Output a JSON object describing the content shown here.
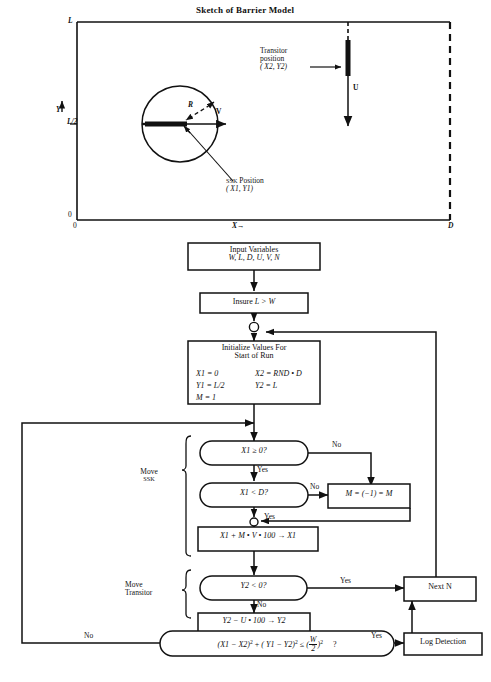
{
  "figure": {
    "title": "Sketch of Barrier Model",
    "sketch": {
      "axis": {
        "y_label": "Y",
        "y_top": "L",
        "y_mid": "L/2",
        "y_zero": "0",
        "x_zero": "0",
        "x_label": "X",
        "x_right": "D"
      },
      "annotations": {
        "radius": "R",
        "velocity_v": "V",
        "velocity_u": "U",
        "transitor_line1": "Transitor",
        "transitor_line2": "position",
        "transitor_line3": "( X2, Y2)",
        "ssk_line1_small": "SSK",
        "ssk_line1_rest": " Position",
        "ssk_line2": "( X1, Y1)"
      }
    }
  },
  "flowchart": {
    "nodes": {
      "input_variables": {
        "line1": "Input Variables",
        "line2": "W, L, D, U, V, N"
      },
      "insure": {
        "prefix": "Insure ",
        "expr": "L > W"
      },
      "initialize": {
        "line1": "Initialize Values For",
        "line2": "Start of Run",
        "r1c1": "X1 = 0",
        "r1c2": "X2 = RND • D",
        "r2c1": "Y1 = L/2",
        "r2c2": "Y2 = L",
        "r3c1": "M = 1"
      },
      "decision_x1_ge_0": "X1 ≥ 0?",
      "decision_x1_lt_d": "X1 < D?",
      "flip_m": "M = (−1) = M",
      "update_x1": "X1 + M • V • 100 → X1",
      "decision_y2_lt_0": "Y2 < 0?",
      "update_y2": "Y2 − U • 100 → Y2",
      "detection_test": {
        "open_paren": "(",
        "term1": "X1 − X2",
        "exp1": "2",
        "plus": " + ",
        "term2": "( Y1 − Y2)",
        "exp2": "2",
        "leq": " ≤ ",
        "frac_num": "W",
        "frac_den": "2",
        "exp3": "2",
        "question": "?"
      },
      "next_n": "Next N",
      "log_detection": "Log Detection"
    },
    "group_labels": {
      "move_ssk_line1": "Move",
      "move_ssk_line2": "SSK",
      "move_transitor_line1": "Move",
      "move_transitor_line2": "Transitor"
    },
    "edge_labels": {
      "no_x1_ge_0": "No",
      "yes_x1_ge_0": "Yes",
      "no_x1_lt_d": "No",
      "yes_x1_lt_d": "Yes",
      "yes_y2_lt_0": "Yes",
      "no_y2_lt_0": "No",
      "yes_detection": "Yes",
      "no_detection": "No"
    }
  },
  "colors": {
    "ink": "#111111",
    "paper": "#ffffff"
  }
}
